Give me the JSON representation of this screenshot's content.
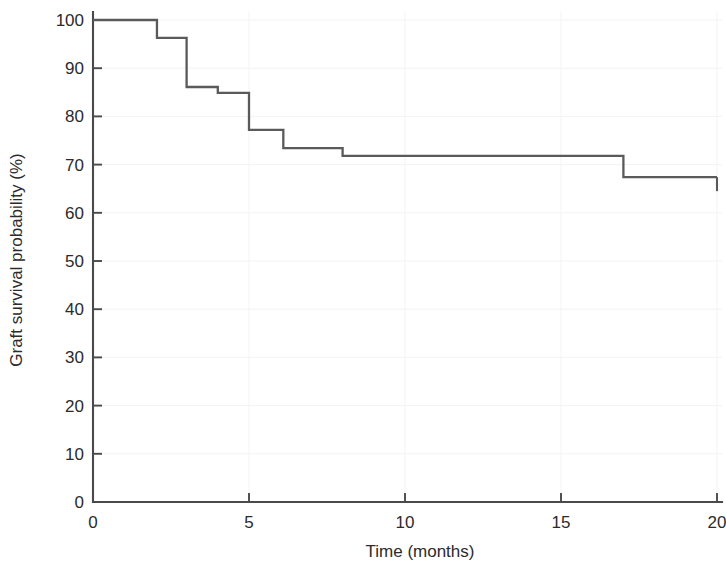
{
  "chart_data": {
    "type": "line",
    "subtype": "kaplan-meier-step",
    "title": "",
    "xlabel": "Time (months)",
    "ylabel": "Graft survival probability (%)",
    "xlim": [
      0,
      20
    ],
    "ylim": [
      0,
      100
    ],
    "xticks": [
      0,
      5,
      10,
      15,
      20
    ],
    "xtick_labels": [
      "0",
      "5",
      "10",
      "15",
      "20"
    ],
    "yticks": [
      0,
      10,
      20,
      30,
      40,
      50,
      60,
      70,
      80,
      90,
      100
    ],
    "ytick_labels": [
      "0",
      "10",
      "20",
      "30",
      "40",
      "50",
      "60",
      "70",
      "80",
      "90",
      "100"
    ],
    "grid": "faint",
    "legend": "none",
    "series": [
      {
        "name": "Graft survival",
        "step": "post",
        "color": "#5a5a5a",
        "x": [
          0,
          2.05,
          3.0,
          4.0,
          5.0,
          6.1,
          8.0,
          17.0,
          20.0
        ],
        "y": [
          100,
          96.3,
          86.1,
          84.9,
          77.2,
          73.4,
          71.8,
          67.4,
          67.4
        ],
        "points": [
          {
            "time": 0,
            "survival": 100
          },
          {
            "time": 2.05,
            "survival": 96.3
          },
          {
            "time": 3.0,
            "survival": 86.1
          },
          {
            "time": 4.0,
            "survival": 84.9
          },
          {
            "time": 5.0,
            "survival": 77.2
          },
          {
            "time": 6.1,
            "survival": 73.4
          },
          {
            "time": 8.0,
            "survival": 71.8
          },
          {
            "time": 17.0,
            "survival": 67.4
          },
          {
            "time": 20.0,
            "survival": 67.4
          }
        ],
        "censor_times": [
          20.0
        ]
      }
    ]
  },
  "axes": {
    "x_title": "Time (months)",
    "y_title": "Graft survival probability (%)"
  },
  "colors": {
    "curve": "#5a5a5a",
    "axis": "#4a4a4a",
    "text": "#2b2b2b",
    "grid": "#f3f3f3",
    "background": "#ffffff"
  }
}
